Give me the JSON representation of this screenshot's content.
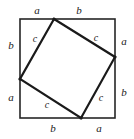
{
  "figure": {
    "stroke_color": "#262626",
    "inner_stroke_color": "#1a1a1a",
    "background_color": "#ffffff",
    "outer_square": {
      "x": 20,
      "y": 19,
      "width": 95,
      "height": 99,
      "stroke_width": 1.6
    },
    "inner_square": {
      "stroke_width": 2.2,
      "vertices": [
        {
          "name": "top-vertex",
          "x": 54,
          "y": 19
        },
        {
          "name": "right-vertex",
          "x": 115,
          "y": 57
        },
        {
          "name": "bottom-vertex",
          "x": 81,
          "y": 118
        },
        {
          "name": "left-vertex",
          "x": 20,
          "y": 79
        }
      ]
    },
    "labels": [
      {
        "name": "label-top-left-a",
        "text": "a",
        "x": 37,
        "y": 10,
        "kind": "leg"
      },
      {
        "name": "label-top-right-b",
        "text": "b",
        "x": 79,
        "y": 10,
        "kind": "leg"
      },
      {
        "name": "label-right-top-a",
        "text": "a",
        "x": 124,
        "y": 41,
        "kind": "leg"
      },
      {
        "name": "label-right-bottom-b",
        "text": "b",
        "x": 124,
        "y": 92,
        "kind": "leg"
      },
      {
        "name": "label-bottom-right-a",
        "text": "a",
        "x": 99,
        "y": 128,
        "kind": "leg"
      },
      {
        "name": "label-bottom-left-b",
        "text": "b",
        "x": 53,
        "y": 128,
        "kind": "leg"
      },
      {
        "name": "label-left-bottom-a",
        "text": "a",
        "x": 11,
        "y": 97,
        "kind": "leg"
      },
      {
        "name": "label-left-top-b",
        "text": "b",
        "x": 11,
        "y": 45,
        "kind": "leg"
      },
      {
        "name": "label-hyp-top-left-c",
        "text": "c",
        "x": 35,
        "y": 39,
        "kind": "hypotenuse"
      },
      {
        "name": "label-hyp-top-right-c",
        "text": "c",
        "x": 96,
        "y": 38,
        "kind": "hypotenuse"
      },
      {
        "name": "label-hyp-bottom-right-c",
        "text": "c",
        "x": 101,
        "y": 98,
        "kind": "hypotenuse"
      },
      {
        "name": "label-hyp-bottom-left-c",
        "text": "c",
        "x": 47,
        "y": 105,
        "kind": "hypotenuse"
      }
    ]
  }
}
